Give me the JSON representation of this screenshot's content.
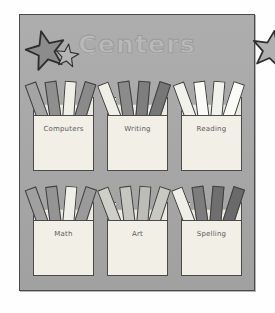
{
  "board": {
    "title": "Centers",
    "background_color": "#a9a9a9",
    "border_color": "#4a4a4a",
    "title_color": "#b9b9b9"
  },
  "decorations": {
    "left_cluster": {
      "name": "star-cluster-left",
      "stars": [
        {
          "name": "star-large",
          "fill": "#8c8c8c",
          "stroke": "#2e2e2e",
          "size": 44,
          "x": 0,
          "y": 6,
          "rotate": -14
        },
        {
          "name": "star-small",
          "fill": "#b5b5b5",
          "stroke": "#2e2e2e",
          "size": 26,
          "x": 30,
          "y": 20,
          "rotate": 8
        }
      ]
    },
    "right_cluster": {
      "name": "star-cluster-right",
      "stars": [
        {
          "name": "star-large",
          "fill": "#b0b0b0",
          "stroke": "#2e2e2e",
          "size": 42,
          "x": 0,
          "y": 6,
          "rotate": 10
        },
        {
          "name": "star-small",
          "fill": "#b5b5b5",
          "stroke": "#2e2e2e",
          "size": 25,
          "x": 32,
          "y": 19,
          "rotate": -10
        }
      ]
    }
  },
  "pockets": [
    {
      "label": "Computers",
      "name": "pocket-computers",
      "pocket_fill": "#f1efe6",
      "back_fill": "#eceae1",
      "sticks": [
        {
          "fill": "#a4a4a4",
          "rotate": -20,
          "left": 5
        },
        {
          "fill": "#8f8f8f",
          "rotate": -8,
          "left": 17
        },
        {
          "fill": "#efefe8",
          "rotate": 4,
          "left": 29
        },
        {
          "fill": "#8a8a8a",
          "rotate": 17,
          "left": 40
        }
      ]
    },
    {
      "label": "Writing",
      "name": "pocket-writing",
      "pocket_fill": "#f1efe6",
      "back_fill": "#eceae1",
      "sticks": [
        {
          "fill": "#efefe8",
          "rotate": -21,
          "left": 4
        },
        {
          "fill": "#8b8b8b",
          "rotate": -8,
          "left": 16
        },
        {
          "fill": "#7e7e7e",
          "rotate": 5,
          "left": 28
        },
        {
          "fill": "#777777",
          "rotate": 18,
          "left": 40
        }
      ]
    },
    {
      "label": "Reading",
      "name": "pocket-reading",
      "pocket_fill": "#f1efe6",
      "back_fill": "#eceae1",
      "sticks": [
        {
          "fill": "#f2f2ec",
          "rotate": -20,
          "left": 5
        },
        {
          "fill": "#fafaf6",
          "rotate": -7,
          "left": 17
        },
        {
          "fill": "#f2f2ec",
          "rotate": 5,
          "left": 29
        },
        {
          "fill": "#fafaf6",
          "rotate": 18,
          "left": 40
        }
      ]
    },
    {
      "label": "Math",
      "name": "pocket-math",
      "pocket_fill": "#f1efe6",
      "back_fill": "#eceae1",
      "sticks": [
        {
          "fill": "#a0a0a0",
          "rotate": -20,
          "left": 5
        },
        {
          "fill": "#949494",
          "rotate": -7,
          "left": 17
        },
        {
          "fill": "#efefe8",
          "rotate": 5,
          "left": 29
        },
        {
          "fill": "#9a9a9a",
          "rotate": 18,
          "left": 40
        }
      ]
    },
    {
      "label": "Art",
      "name": "pocket-art",
      "pocket_fill": "#f1efe6",
      "back_fill": "#eceae1",
      "sticks": [
        {
          "fill": "#cfcfc9",
          "rotate": -21,
          "left": 4
        },
        {
          "fill": "#c6c6c0",
          "rotate": -7,
          "left": 17
        },
        {
          "fill": "#bdbdb7",
          "rotate": 5,
          "left": 29
        },
        {
          "fill": "#c9c9c3",
          "rotate": 18,
          "left": 40
        }
      ]
    },
    {
      "label": "Spelling",
      "name": "pocket-spelling",
      "pocket_fill": "#f1efe6",
      "back_fill": "#eceae1",
      "sticks": [
        {
          "fill": "#efefe8",
          "rotate": -21,
          "left": 4
        },
        {
          "fill": "#7c7c7c",
          "rotate": -8,
          "left": 16
        },
        {
          "fill": "#6f6f6f",
          "rotate": 5,
          "left": 28
        },
        {
          "fill": "#6a6a6a",
          "rotate": 18,
          "left": 40
        }
      ]
    }
  ]
}
